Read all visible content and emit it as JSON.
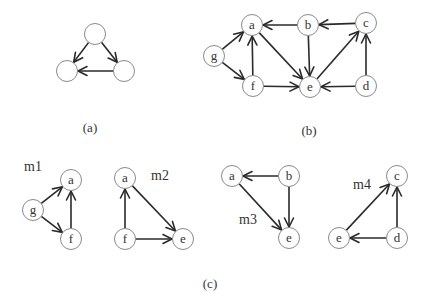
{
  "node_radius": 10.5,
  "panels": [
    {
      "id": "a",
      "caption": "(a)",
      "caption_pos": [
        90,
        127
      ],
      "nodes": [
        {
          "id": "t",
          "label": "",
          "x": 95,
          "y": 34
        },
        {
          "id": "l",
          "label": "",
          "x": 67,
          "y": 71
        },
        {
          "id": "r",
          "label": "",
          "x": 124,
          "y": 71
        }
      ],
      "edges": [
        [
          "t",
          "l"
        ],
        [
          "t",
          "r"
        ],
        [
          "r",
          "l"
        ]
      ]
    },
    {
      "id": "b",
      "caption": "(b)",
      "caption_pos": [
        309,
        130
      ],
      "nodes": [
        {
          "id": "a",
          "label": "a",
          "x": 252,
          "y": 25
        },
        {
          "id": "b",
          "label": "b",
          "x": 308,
          "y": 25
        },
        {
          "id": "c",
          "label": "c",
          "x": 366,
          "y": 23
        },
        {
          "id": "g",
          "label": "g",
          "x": 214,
          "y": 56
        },
        {
          "id": "f",
          "label": "f",
          "x": 253,
          "y": 86
        },
        {
          "id": "e",
          "label": "e",
          "x": 310,
          "y": 87
        },
        {
          "id": "d",
          "label": "d",
          "x": 366,
          "y": 86
        }
      ],
      "edges": [
        [
          "b",
          "a"
        ],
        [
          "c",
          "b"
        ],
        [
          "g",
          "a"
        ],
        [
          "g",
          "f"
        ],
        [
          "f",
          "a"
        ],
        [
          "a",
          "e"
        ],
        [
          "b",
          "e"
        ],
        [
          "f",
          "e"
        ],
        [
          "e",
          "c"
        ],
        [
          "d",
          "e"
        ],
        [
          "d",
          "c"
        ]
      ]
    },
    {
      "id": "m1",
      "label": "m1",
      "label_pos": [
        33,
        166
      ],
      "nodes": [
        {
          "id": "a",
          "label": "a",
          "x": 71,
          "y": 180
        },
        {
          "id": "g",
          "label": "g",
          "x": 33,
          "y": 210
        },
        {
          "id": "f",
          "label": "f",
          "x": 71,
          "y": 239
        }
      ],
      "edges": [
        [
          "g",
          "a"
        ],
        [
          "g",
          "f"
        ],
        [
          "f",
          "a"
        ]
      ]
    },
    {
      "id": "m2",
      "label": "m2",
      "label_pos": [
        160,
        175
      ],
      "nodes": [
        {
          "id": "a",
          "label": "a",
          "x": 125,
          "y": 178
        },
        {
          "id": "f",
          "label": "f",
          "x": 125,
          "y": 239
        },
        {
          "id": "e",
          "label": "e",
          "x": 183,
          "y": 239
        }
      ],
      "edges": [
        [
          "f",
          "a"
        ],
        [
          "a",
          "e"
        ],
        [
          "f",
          "e"
        ]
      ]
    },
    {
      "id": "m3",
      "label": "m3",
      "label_pos": [
        248,
        219
      ],
      "nodes": [
        {
          "id": "a",
          "label": "a",
          "x": 232,
          "y": 176
        },
        {
          "id": "b",
          "label": "b",
          "x": 289,
          "y": 176
        },
        {
          "id": "e",
          "label": "e",
          "x": 289,
          "y": 238
        }
      ],
      "edges": [
        [
          "b",
          "a"
        ],
        [
          "a",
          "e"
        ],
        [
          "b",
          "e"
        ]
      ]
    },
    {
      "id": "m4",
      "label": "m4",
      "label_pos": [
        362,
        184
      ],
      "nodes": [
        {
          "id": "c",
          "label": "c",
          "x": 397,
          "y": 176
        },
        {
          "id": "e",
          "label": "e",
          "x": 339,
          "y": 238
        },
        {
          "id": "d",
          "label": "d",
          "x": 397,
          "y": 238
        }
      ],
      "edges": [
        [
          "e",
          "c"
        ],
        [
          "d",
          "c"
        ],
        [
          "d",
          "e"
        ]
      ]
    }
  ],
  "figure_caption": "(c)",
  "figure_caption_pos": [
    210,
    283
  ],
  "colors": {
    "edge": "#2a2a2a",
    "node_stroke": "#8a8a8a",
    "text": "#333333"
  }
}
